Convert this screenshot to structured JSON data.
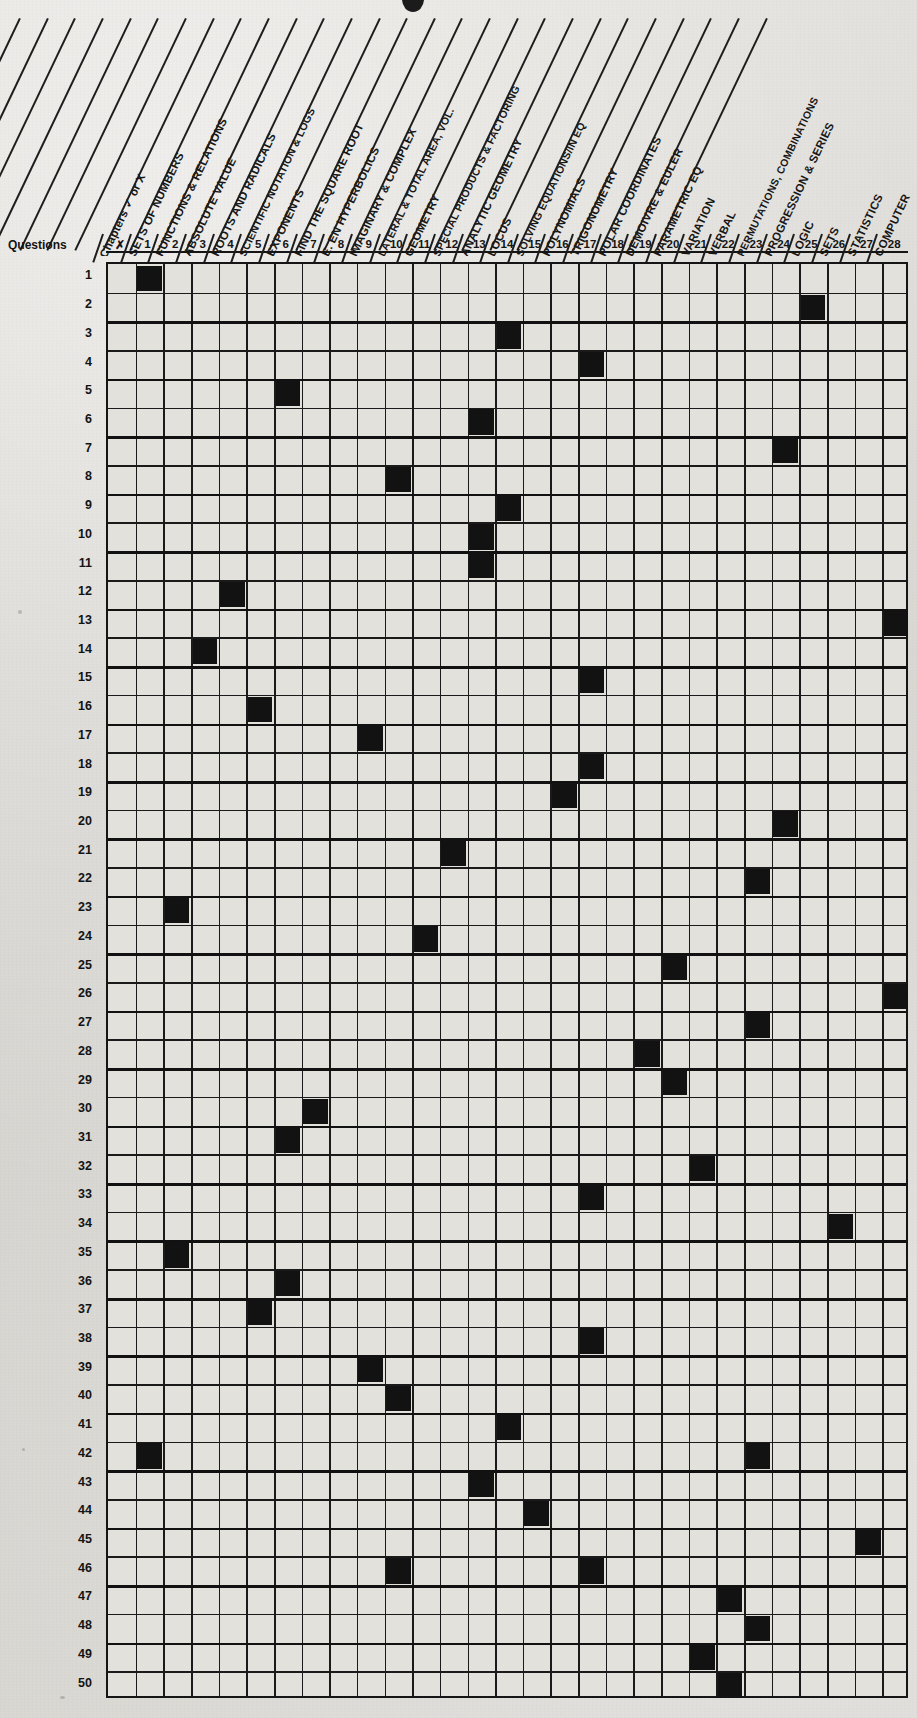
{
  "sheet": {
    "questions_label": "Questions",
    "row_axis_title": "Questions",
    "col_axis_title": "Chapters"
  },
  "columns": [
    {
      "num": "X",
      "label": "Chapters  ✓ or X"
    },
    {
      "num": "1",
      "label": "SETS OF NUMBERS"
    },
    {
      "num": "2",
      "label": "FUNCTIONS & RELATIONS"
    },
    {
      "num": "3",
      "label": "ABSOLUTE VALUE"
    },
    {
      "num": "4",
      "label": "ROOTS AND RADICALS"
    },
    {
      "num": "5",
      "label": "SCIENTIFIC NOTATION & LOGS"
    },
    {
      "num": "6",
      "label": "EXPONENTS"
    },
    {
      "num": "7",
      "label": "FIND THE SQUARE ROOT"
    },
    {
      "num": "8",
      "label": "E. EN HYPERBOLICS"
    },
    {
      "num": "9",
      "label": "IMAGINARY & COMPLEX"
    },
    {
      "num": "10",
      "label": "LATERAL & TOTAL AREA, VOL."
    },
    {
      "num": "11",
      "label": "GEOMETRY"
    },
    {
      "num": "12",
      "label": "SPECIAL PRODUCTS & FACTORING"
    },
    {
      "num": "13",
      "label": "ANALYTIC GEOMETRY"
    },
    {
      "num": "14",
      "label": "LOCUS"
    },
    {
      "num": "15",
      "label": "SOLVING EQUATIONS/IN EQ"
    },
    {
      "num": "16",
      "label": "POLYNOMIALS"
    },
    {
      "num": "17",
      "label": "TRIGONOMETRY"
    },
    {
      "num": "18",
      "label": "POLAR COORDINATES"
    },
    {
      "num": "19",
      "label": "DEMOIVRE & EULER"
    },
    {
      "num": "20",
      "label": "PARAMETRIC EQ"
    },
    {
      "num": "21",
      "label": "VARIATION"
    },
    {
      "num": "22",
      "label": "VERBAL"
    },
    {
      "num": "23",
      "label": "PERMUTATIONS, COMBINATIONS"
    },
    {
      "num": "24",
      "label": "PROGRESSION & SERIES"
    },
    {
      "num": "25",
      "label": "LOGIC"
    },
    {
      "num": "26",
      "label": "SETS"
    },
    {
      "num": "27",
      "label": "STATISTICS"
    },
    {
      "num": "28",
      "label": "COMPUTER"
    }
  ],
  "rows": [
    "1",
    "2",
    "3",
    "4",
    "5",
    "6",
    "7",
    "8",
    "9",
    "10",
    "11",
    "12",
    "13",
    "14",
    "15",
    "16",
    "17",
    "18",
    "19",
    "20",
    "21",
    "22",
    "23",
    "24",
    "25",
    "26",
    "27",
    "28",
    "29",
    "30",
    "31",
    "32",
    "33",
    "34",
    "35",
    "36",
    "37",
    "38",
    "39",
    "40",
    "41",
    "42",
    "43",
    "44",
    "45",
    "46",
    "47",
    "48",
    "49",
    "50"
  ],
  "chart_data": {
    "type": "heatmap",
    "xlabel": "Chapters",
    "ylabel": "Questions",
    "grid": true,
    "x": [
      "1",
      "2",
      "3",
      "4",
      "5",
      "6",
      "7",
      "8",
      "9",
      "10",
      "11",
      "12",
      "13",
      "14",
      "15",
      "16",
      "17",
      "18",
      "19",
      "20",
      "21",
      "22",
      "23",
      "24",
      "25",
      "26",
      "27",
      "28"
    ],
    "y": [
      "1",
      "2",
      "3",
      "4",
      "5",
      "6",
      "7",
      "8",
      "9",
      "10",
      "11",
      "12",
      "13",
      "14",
      "15",
      "16",
      "17",
      "18",
      "19",
      "20",
      "21",
      "22",
      "23",
      "24",
      "25",
      "26",
      "27",
      "28",
      "29",
      "30",
      "31",
      "32",
      "33",
      "34",
      "35",
      "36",
      "37",
      "38",
      "39",
      "40",
      "41",
      "42",
      "43",
      "44",
      "45",
      "46",
      "47",
      "48",
      "49",
      "50"
    ],
    "marked_cells": [
      {
        "row": 1,
        "cols": [
          1
        ]
      },
      {
        "row": 2,
        "cols": [
          25
        ]
      },
      {
        "row": 3,
        "cols": [
          14
        ]
      },
      {
        "row": 4,
        "cols": [
          17
        ]
      },
      {
        "row": 5,
        "cols": [
          6
        ]
      },
      {
        "row": 6,
        "cols": [
          13
        ]
      },
      {
        "row": 7,
        "cols": [
          24
        ]
      },
      {
        "row": 8,
        "cols": [
          10
        ]
      },
      {
        "row": 9,
        "cols": [
          14
        ]
      },
      {
        "row": 10,
        "cols": [
          13
        ]
      },
      {
        "row": 11,
        "cols": [
          13
        ]
      },
      {
        "row": 12,
        "cols": [
          4
        ]
      },
      {
        "row": 13,
        "cols": [
          28
        ]
      },
      {
        "row": 14,
        "cols": [
          3
        ]
      },
      {
        "row": 15,
        "cols": [
          17
        ]
      },
      {
        "row": 16,
        "cols": [
          5
        ]
      },
      {
        "row": 17,
        "cols": [
          9
        ]
      },
      {
        "row": 18,
        "cols": [
          17
        ]
      },
      {
        "row": 19,
        "cols": [
          16
        ]
      },
      {
        "row": 20,
        "cols": [
          24
        ]
      },
      {
        "row": 21,
        "cols": [
          12
        ]
      },
      {
        "row": 22,
        "cols": [
          23
        ]
      },
      {
        "row": 23,
        "cols": [
          2
        ]
      },
      {
        "row": 24,
        "cols": [
          11
        ]
      },
      {
        "row": 25,
        "cols": [
          20
        ]
      },
      {
        "row": 26,
        "cols": [
          28
        ]
      },
      {
        "row": 27,
        "cols": [
          23
        ]
      },
      {
        "row": 28,
        "cols": [
          19
        ]
      },
      {
        "row": 29,
        "cols": [
          20
        ]
      },
      {
        "row": 30,
        "cols": [
          7
        ]
      },
      {
        "row": 31,
        "cols": [
          6
        ]
      },
      {
        "row": 32,
        "cols": [
          21
        ]
      },
      {
        "row": 33,
        "cols": [
          17
        ]
      },
      {
        "row": 34,
        "cols": [
          26
        ]
      },
      {
        "row": 35,
        "cols": [
          2
        ]
      },
      {
        "row": 36,
        "cols": [
          6
        ]
      },
      {
        "row": 37,
        "cols": [
          5
        ]
      },
      {
        "row": 38,
        "cols": [
          17
        ]
      },
      {
        "row": 39,
        "cols": [
          9
        ]
      },
      {
        "row": 40,
        "cols": [
          10
        ]
      },
      {
        "row": 41,
        "cols": [
          14
        ]
      },
      {
        "row": 42,
        "cols": [
          1,
          23
        ]
      },
      {
        "row": 43,
        "cols": [
          13
        ]
      },
      {
        "row": 44,
        "cols": [
          15
        ]
      },
      {
        "row": 45,
        "cols": [
          27
        ]
      },
      {
        "row": 46,
        "cols": [
          10,
          17
        ]
      },
      {
        "row": 47,
        "cols": [
          22
        ]
      },
      {
        "row": 48,
        "cols": [
          23
        ]
      },
      {
        "row": 49,
        "cols": [
          21
        ]
      },
      {
        "row": 50,
        "cols": [
          22
        ]
      }
    ]
  },
  "colors": {
    "paper": "#d8d8d4",
    "ink": "#141414",
    "cell": "#e3e1dc",
    "mark": "#121212"
  }
}
